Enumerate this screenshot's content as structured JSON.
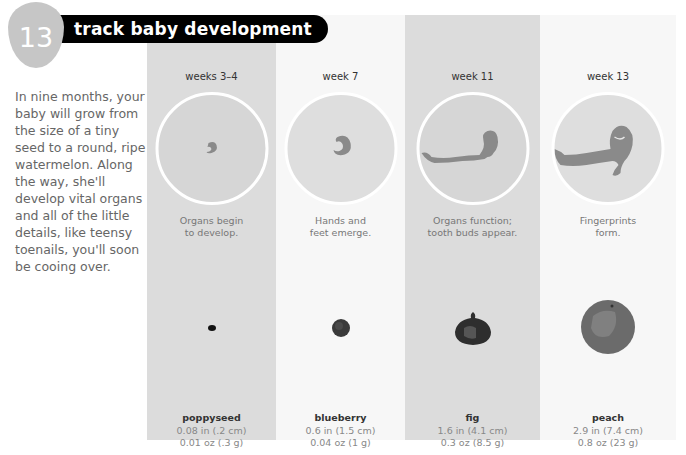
{
  "header": {
    "number": "13",
    "title": "track baby development"
  },
  "intro": {
    "text": "In nine months, your baby will grow from the size of a tiny seed to a round, ripe watermelon. Along the way, she'll develop vital organs and all of the little details, like teensy toenails, you'll soon be cooing over."
  },
  "colors": {
    "gray_column": "#dcdcdc",
    "white_column": "#f7f7f7",
    "badge": "#c6c6c6",
    "title_bar": "#000000",
    "embryo": "#8a8a8a"
  },
  "stages": [
    {
      "week": "weeks 3–4",
      "description_line1": "Organs begin",
      "description_line2": "to develop.",
      "embryo_icon": "embryo-tiny-icon",
      "fruit": "poppyseed",
      "length": "0.08 in (.2 cm)",
      "weight": "0.01 oz (.3 g)"
    },
    {
      "week": "week 7",
      "description_line1": "Hands and",
      "description_line2": "feet emerge.",
      "embryo_icon": "embryo-small-icon",
      "fruit": "blueberry",
      "length": "0.6 in (1.5 cm)",
      "weight": "0.04 oz (1 g)"
    },
    {
      "week": "week 11",
      "description_line1": "Organs function;",
      "description_line2": "tooth buds appear.",
      "embryo_icon": "fetus-with-cord-icon",
      "fruit": "fig",
      "length": "1.6 in (4.1 cm)",
      "weight": "0.3 oz (8.5 g)"
    },
    {
      "week": "week 13",
      "description_line1": "Fingerprints",
      "description_line2": "form.",
      "embryo_icon": "fetus-large-icon",
      "fruit": "peach",
      "length": "2.9 in (7.4 cm)",
      "weight": "0.8 oz (23 g)"
    }
  ]
}
